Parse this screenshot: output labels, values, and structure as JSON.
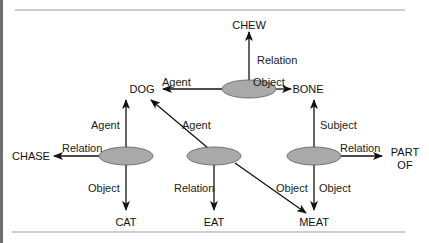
{
  "diagram": {
    "type": "semantic-network",
    "nodes": {
      "chew": "CHEW",
      "dog": "DOG",
      "bone": "BONE",
      "chase": "CHASE",
      "cat": "CAT",
      "eat": "EAT",
      "meat": "MEAT",
      "part_of_line1": "PART",
      "part_of_line2": "OF"
    },
    "propositions": [
      {
        "id": "chew-proposition",
        "edges": {
          "relation": "Relation",
          "agent": "Agent",
          "object": "Object"
        },
        "relation_target": "CHEW",
        "agent_target": "DOG",
        "object_target": "BONE"
      },
      {
        "id": "chase-proposition",
        "edges": {
          "agent": "Agent",
          "relation": "Relation",
          "object": "Object"
        },
        "relation_target": "CHASE",
        "agent_target": "DOG",
        "object_target": "CAT"
      },
      {
        "id": "eat-proposition",
        "edges": {
          "agent": "Agent",
          "relation": "Relation",
          "object": "Object"
        },
        "relation_target": "EAT",
        "agent_target": "DOG",
        "object_target": "MEAT"
      },
      {
        "id": "part-of-proposition",
        "edges": {
          "subject": "Subject",
          "relation": "Relation",
          "object": "Object"
        },
        "relation_target": "PART OF",
        "subject_target": "BONE",
        "object_target": "MEAT"
      }
    ],
    "colors": {
      "ellipse_fill": "#a9a9a9",
      "ellipse_stroke": "#5a5a5a",
      "line": "#111111",
      "rule": "#bdbdbd",
      "left_border": "#6f6f6f"
    }
  }
}
